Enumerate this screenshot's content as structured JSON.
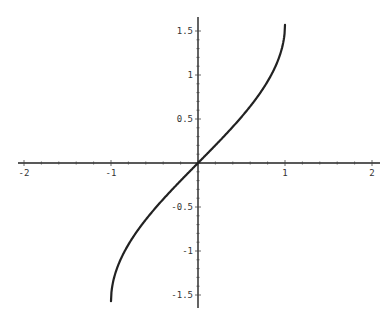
{
  "chart_data": {
    "type": "line",
    "title": "",
    "xlabel": "",
    "ylabel": "",
    "function": "y = arcsin(x)",
    "xlim": [
      -2.0,
      2.0
    ],
    "ylim": [
      -1.6,
      1.6
    ],
    "grid": false,
    "legend": null,
    "x_ticks": [
      {
        "value": -2,
        "label": "-2"
      },
      {
        "value": -1,
        "label": "-1"
      },
      {
        "value": 1,
        "label": "1"
      },
      {
        "value": 2,
        "label": "2"
      }
    ],
    "y_ticks": [
      {
        "value": 1.5,
        "label": "1.5"
      },
      {
        "value": 1,
        "label": "1"
      },
      {
        "value": 0.5,
        "label": "0.5"
      },
      {
        "value": -0.5,
        "label": "-0.5"
      },
      {
        "value": -1,
        "label": "-1"
      },
      {
        "value": -1.5,
        "label": "-1.5"
      }
    ],
    "series": [
      {
        "name": "arcsin(x)",
        "color": "#222222",
        "x": [
          -1.0,
          -0.99,
          -0.95,
          -0.9,
          -0.8,
          -0.7,
          -0.6,
          -0.5,
          -0.4,
          -0.3,
          -0.2,
          -0.1,
          0.0,
          0.1,
          0.2,
          0.3,
          0.4,
          0.5,
          0.6,
          0.7,
          0.8,
          0.9,
          0.95,
          0.99,
          1.0
        ],
        "y": [
          -1.571,
          -1.429,
          -1.253,
          -1.12,
          -0.927,
          -0.775,
          -0.644,
          -0.524,
          -0.412,
          -0.305,
          -0.201,
          -0.1,
          0.0,
          0.1,
          0.201,
          0.305,
          0.412,
          0.524,
          0.644,
          0.775,
          0.927,
          1.12,
          1.253,
          1.429,
          1.571
        ]
      }
    ]
  }
}
